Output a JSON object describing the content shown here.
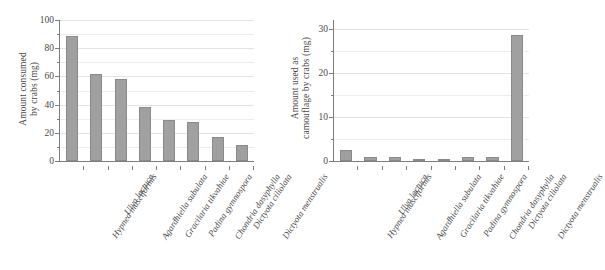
{
  "chart_data": [
    {
      "type": "bar",
      "panel": "left",
      "title": "",
      "xlabel": "",
      "ylabel": "Amount consumed by crabs (mg)",
      "ylabel_line1": "Amount consumed",
      "ylabel_line2": "by crabs (mg)",
      "ylim": [
        0,
        100
      ],
      "ytick_labels": [
        "0",
        "20",
        "40",
        "60",
        "80",
        "100"
      ],
      "ytick_values": [
        0,
        20,
        40,
        60,
        80,
        100
      ],
      "yminor_values": [
        10,
        30,
        50,
        70,
        90
      ],
      "grid": true,
      "legend": "none",
      "categories": [
        "Hypnea musciformis",
        "Ulva lactuca",
        "Agardhiella subulata",
        "Gracilaria tikvahiae",
        "Padina gymnospora",
        "Chondria dasyphylla",
        "Dictyota ciliolata",
        "Dictyota menstrualis"
      ],
      "values": [
        89,
        62,
        58,
        38,
        29,
        28,
        17,
        11.5
      ],
      "bar_color": "#a0a0a0",
      "bar_edge_color": "#8a8a8a"
    },
    {
      "type": "bar",
      "panel": "right",
      "title": "",
      "xlabel": "",
      "ylabel": "Amount used as camouflage by crabs (mg)",
      "ylabel_line1": "Amount used as",
      "ylabel_line2": "camouflage by crabs (mg)",
      "ylim": [
        0,
        32
      ],
      "ytick_labels": [
        "0",
        "10",
        "20",
        "30"
      ],
      "ytick_values": [
        0,
        10,
        20,
        30
      ],
      "yminor_values": [
        5,
        15,
        25
      ],
      "grid": true,
      "legend": "none",
      "categories": [
        "Hypnea musciformis",
        "Ulva lactuca",
        "Agardhiella subulata",
        "Gracilaria tikvahiae",
        "Padina gymnospora",
        "Chondria dasyphylla",
        "Dictyota ciliolata",
        "Dictyota menstrualis"
      ],
      "values": [
        2.6,
        1.0,
        1.0,
        0.2,
        0.2,
        0.8,
        1.0,
        28.5
      ],
      "bar_color": "#a0a0a0",
      "bar_edge_color": "#8a8a8a"
    }
  ]
}
